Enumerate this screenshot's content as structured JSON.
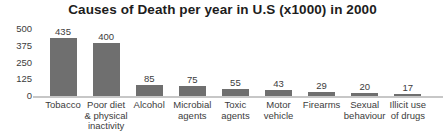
{
  "chart_data": {
    "type": "bar",
    "title": "Causes of Death per year in U.S (x1000) in 2000",
    "categories": [
      "Tobacco",
      "Poor diet & physical inactivity",
      "Alcohol",
      "Microbial agents",
      "Toxic agents",
      "Motor vehicle",
      "Firearms",
      "Sexual behaviour",
      "Illicit use of drugs"
    ],
    "category_label_lines": [
      [
        "Tobacco"
      ],
      [
        "Poor diet",
        "& physical",
        "inactivity"
      ],
      [
        "Alcohol"
      ],
      [
        "Microbial",
        "agents"
      ],
      [
        "Toxic",
        "agents"
      ],
      [
        "Motor",
        "vehicle"
      ],
      [
        "Firearms"
      ],
      [
        "Sexual",
        "behaviour"
      ],
      [
        "Illicit use",
        "of drugs"
      ]
    ],
    "values": [
      435,
      400,
      85,
      75,
      55,
      43,
      29,
      20,
      17
    ],
    "yticks": [
      0,
      125,
      250,
      375,
      500
    ],
    "ylim": [
      0,
      500
    ],
    "xlabel": "",
    "ylabel": "",
    "grid": false,
    "legend": null,
    "data_labels_shown": true
  },
  "colors": {
    "bar": "#6f6f6f",
    "title_text": "#1d1d1d",
    "label_text": "#3c3c3c",
    "axis_line": "#c7c7c7",
    "background": "#ffffff"
  }
}
